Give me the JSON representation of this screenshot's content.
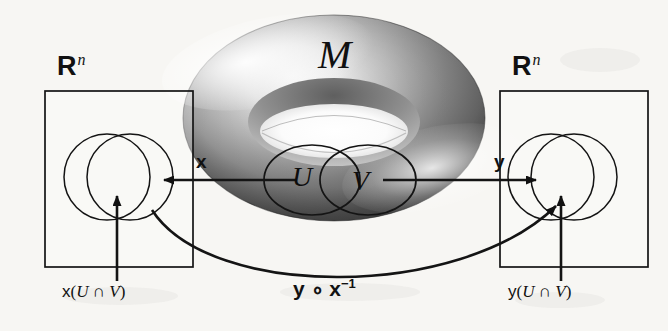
{
  "figure": {
    "background_color": "#f7f6f3",
    "ink_color": "#111111"
  },
  "manifold": {
    "label": "M",
    "patch_u_label": "U",
    "patch_v_label": "V",
    "surface_light": "#fbfbfb",
    "surface_mid": "#9a9a9a",
    "surface_dark": "#4a4a4a"
  },
  "left_chart": {
    "space_label": "R",
    "space_superscript": "n",
    "caption_fn": "x",
    "caption_open": "(",
    "caption_u": "U",
    "caption_cap": " ∩ ",
    "caption_v": "V",
    "caption_close": ")"
  },
  "right_chart": {
    "space_label": "R",
    "space_superscript": "n",
    "caption_fn": "y",
    "caption_open": "(",
    "caption_u": "U",
    "caption_cap": " ∩ ",
    "caption_v": "V",
    "caption_close": ")"
  },
  "maps": {
    "chart_x_label": "x",
    "chart_y_label": "y",
    "transition_fn": "y ∘ x",
    "transition_exponent": "−1"
  }
}
